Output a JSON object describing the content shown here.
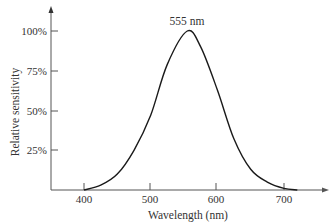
{
  "chart_data": {
    "type": "line",
    "title": "",
    "xlabel": "Wavelength (nm)",
    "ylabel": "Relative sensitivity",
    "x_ticks": [
      "400",
      "500",
      "600",
      "700"
    ],
    "y_ticks": [
      "25%",
      "50%",
      "75%",
      "100%"
    ],
    "xlim": [
      350,
      765
    ],
    "ylim": [
      0,
      1.2
    ],
    "grid": false,
    "annotation": "555 nm",
    "series": [
      {
        "name": "Relative sensitivity",
        "x": [
          400,
          425,
          450,
          475,
          500,
          525,
          555,
          575,
          600,
          625,
          650,
          675,
          700,
          720
        ],
        "values": [
          0.0,
          0.03,
          0.1,
          0.25,
          0.47,
          0.79,
          1.0,
          0.9,
          0.63,
          0.32,
          0.13,
          0.05,
          0.01,
          0.0
        ]
      }
    ]
  },
  "colors": {
    "axis": "#555555",
    "curve": "#1a1a1a",
    "text": "#333333"
  }
}
